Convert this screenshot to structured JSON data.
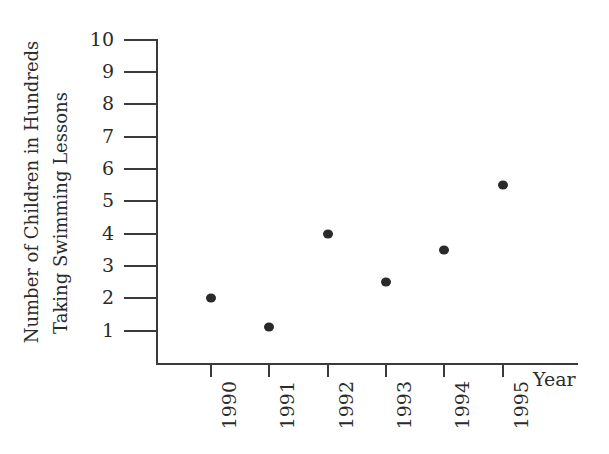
{
  "chart_data": {
    "type": "scatter",
    "title": "",
    "xlabel": "Year",
    "ylabel": "Number of Children in Hundreds Taking Swimming Lessons",
    "ylabel_lines": [
      "Number of Children in Hundreds",
      "Taking Swimming Lessons"
    ],
    "categories": [
      "1990",
      "1991",
      "1992",
      "1993",
      "1994",
      "1995"
    ],
    "x": [
      1990,
      1991,
      1992,
      1993,
      1994,
      1995
    ],
    "values": [
      2.0,
      1.1,
      4.0,
      2.5,
      3.5,
      5.5
    ],
    "points": [
      {
        "x": "1990",
        "y": 2.0
      },
      {
        "x": "1991",
        "y": 1.1
      },
      {
        "x": "1992",
        "y": 4.0
      },
      {
        "x": "1993",
        "y": 2.5
      },
      {
        "x": "1994",
        "y": 3.5
      },
      {
        "x": "1995",
        "y": 5.5
      }
    ],
    "ylim": [
      0,
      10
    ],
    "ytick_labels": [
      "1",
      "2",
      "3",
      "4",
      "5",
      "6",
      "7",
      "8",
      "9",
      "10"
    ],
    "ytick_values": [
      1,
      2,
      3,
      4,
      5,
      6,
      7,
      8,
      9,
      10
    ],
    "grid": false,
    "legend": false,
    "marker_color": "#2a2a2a",
    "axis_color": "#3a3a3a",
    "background_color": "#ffffff"
  }
}
